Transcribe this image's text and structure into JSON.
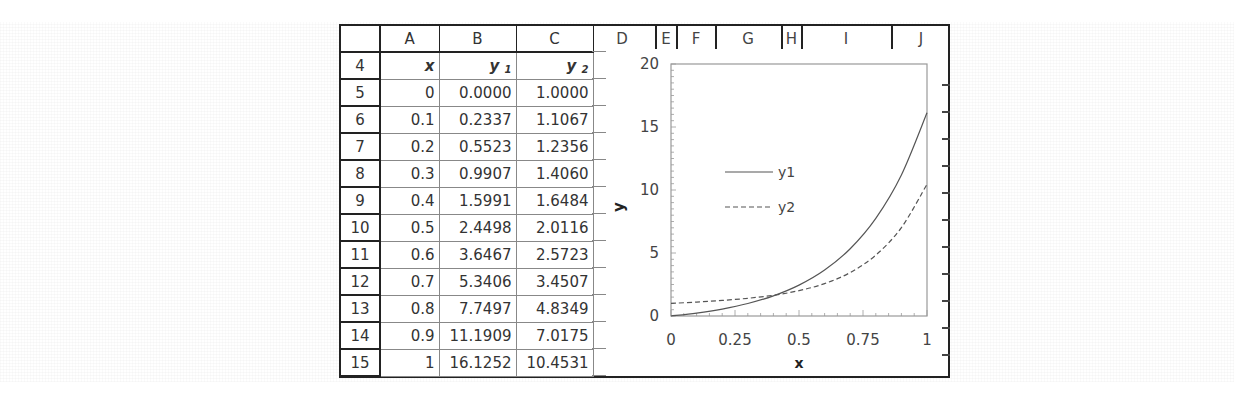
{
  "spreadsheet": {
    "column_headers": [
      "A",
      "B",
      "C",
      "D",
      "E",
      "F",
      "G",
      "H",
      "I",
      "J"
    ],
    "header_row": {
      "row_number": "4",
      "cells": [
        {
          "text": "x",
          "sub": ""
        },
        {
          "text": "y",
          "sub": "1"
        },
        {
          "text": "y",
          "sub": "2"
        }
      ]
    },
    "rows": [
      {
        "row": "5",
        "x": "0",
        "y1": "0.0000",
        "y2": "1.0000"
      },
      {
        "row": "6",
        "x": "0.1",
        "y1": "0.2337",
        "y2": "1.1067"
      },
      {
        "row": "7",
        "x": "0.2",
        "y1": "0.5523",
        "y2": "1.2356"
      },
      {
        "row": "8",
        "x": "0.3",
        "y1": "0.9907",
        "y2": "1.4060"
      },
      {
        "row": "9",
        "x": "0.4",
        "y1": "1.5991",
        "y2": "1.6484"
      },
      {
        "row": "10",
        "x": "0.5",
        "y1": "2.4498",
        "y2": "2.0116"
      },
      {
        "row": "11",
        "x": "0.6",
        "y1": "3.6467",
        "y2": "2.5723"
      },
      {
        "row": "12",
        "x": "0.7",
        "y1": "5.3406",
        "y2": "3.4507"
      },
      {
        "row": "13",
        "x": "0.8",
        "y1": "7.7497",
        "y2": "4.8349"
      },
      {
        "row": "14",
        "x": "0.9",
        "y1": "11.1909",
        "y2": "7.0175"
      },
      {
        "row": "15",
        "x": "1",
        "y1": "16.1252",
        "y2": "10.4531"
      }
    ]
  },
  "chart_data": {
    "type": "line",
    "title": "",
    "xlabel": "x",
    "ylabel": "y",
    "x": [
      0,
      0.1,
      0.2,
      0.3,
      0.4,
      0.5,
      0.6,
      0.7,
      0.8,
      0.9,
      1
    ],
    "series": [
      {
        "name": "y1",
        "style": "solid",
        "values": [
          0.0,
          0.2337,
          0.5523,
          0.9907,
          1.5991,
          2.4498,
          3.6467,
          5.3406,
          7.7497,
          11.1909,
          16.1252
        ]
      },
      {
        "name": "y2",
        "style": "dashed",
        "values": [
          1.0,
          1.1067,
          1.2356,
          1.406,
          1.6484,
          2.0116,
          2.5723,
          3.4507,
          4.8349,
          7.0175,
          10.4531
        ]
      }
    ],
    "xlim": [
      0,
      1
    ],
    "ylim": [
      0,
      20
    ],
    "xticks": [
      "0",
      "0.25",
      "0.5",
      "0.75",
      "1"
    ],
    "yticks": [
      "0",
      "5",
      "10",
      "15",
      "20"
    ],
    "legend": {
      "entries": [
        "y1",
        "y2"
      ],
      "position": "inside upper-left"
    },
    "grid": false,
    "line_color": "#555555"
  }
}
